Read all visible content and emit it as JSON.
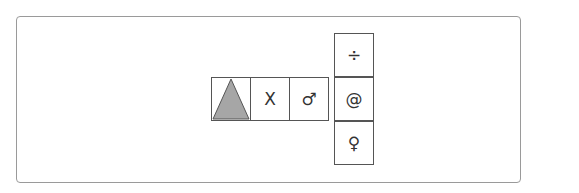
{
  "diagram": {
    "type": "cube-net",
    "cells": [
      {
        "id": "triangle",
        "symbol": "",
        "icon": "triangle-icon",
        "fill": "#a6a6a6"
      },
      {
        "id": "x",
        "symbol": "X"
      },
      {
        "id": "male",
        "symbol": "♂"
      },
      {
        "id": "at",
        "symbol": "@"
      },
      {
        "id": "divide",
        "symbol": "÷"
      },
      {
        "id": "female",
        "symbol": "♀"
      }
    ]
  }
}
